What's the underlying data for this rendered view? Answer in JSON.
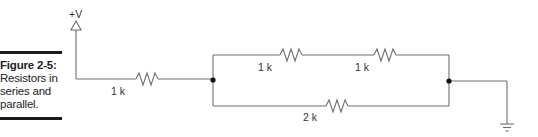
{
  "figure": {
    "number_label": "Figure 2-5:",
    "caption_lines": [
      "Resistors in",
      "series and",
      "parallel."
    ]
  },
  "circuit": {
    "supply_label": "+V",
    "resistors": [
      {
        "id": "R1",
        "value": "1 k",
        "position": "series input"
      },
      {
        "id": "R2",
        "value": "1 k",
        "position": "upper branch left"
      },
      {
        "id": "R3",
        "value": "1 k",
        "position": "upper branch right"
      },
      {
        "id": "R4",
        "value": "2 k",
        "position": "lower branch"
      }
    ],
    "ground_label": "ground",
    "wire_color": "#6e6e6e",
    "node_color": "#111111"
  }
}
